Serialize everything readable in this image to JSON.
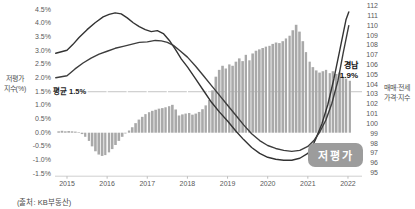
{
  "source_note": "(출처: KB부동산)",
  "chart_data": {
    "type": "combo-bar-line",
    "title": "",
    "left_axis": {
      "title_lines": [
        "저평가",
        "지수(%)"
      ],
      "ticks": [
        "4.5%",
        "4.0%",
        "3.5%",
        "3.0%",
        "2.5%",
        "2.0%",
        "1.5%",
        "1.0%",
        "0.5%",
        "0.0%",
        "-0.5%",
        "-1.0%",
        "-1.5%"
      ],
      "max": 4.5,
      "min": -1.5,
      "step": 0.5
    },
    "right_axis": {
      "title_lines": [
        "매매·전세",
        "가격·지수"
      ],
      "ticks": [
        "112",
        "111",
        "110",
        "109",
        "108",
        "107",
        "106",
        "105",
        "104",
        "103",
        "102",
        "101",
        "100",
        "99",
        "98",
        "97",
        "96",
        "95"
      ],
      "max": 112,
      "min": 95,
      "step": 1
    },
    "x_axis": {
      "ticks": [
        "2015",
        "2016",
        "2017",
        "2018",
        "2019",
        "2020",
        "2021",
        "2022"
      ]
    },
    "average_line": {
      "label": "평균 1.5%",
      "value": 1.5
    },
    "series_label": {
      "region": "경남",
      "value": "1.9%"
    },
    "badge": {
      "label": "저평가"
    },
    "bars": {
      "id": "undervaluation-index",
      "axis": "left",
      "start_time": 2014.75,
      "monthly_values": [
        0.05,
        0.07,
        0.05,
        0.06,
        0.05,
        0.04,
        0.02,
        -0.05,
        -0.15,
        -0.3,
        -0.5,
        -0.68,
        -0.8,
        -0.85,
        -0.82,
        -0.72,
        -0.6,
        -0.45,
        -0.3,
        -0.15,
        -0.03,
        0.08,
        0.2,
        0.35,
        0.48,
        0.58,
        0.68,
        0.75,
        0.8,
        0.84,
        0.88,
        0.9,
        0.93,
        0.97,
        1.02,
        0.85,
        0.63,
        0.67,
        0.7,
        0.72,
        0.66,
        0.7,
        0.76,
        0.86,
        1.0,
        1.2,
        1.55,
        2.05,
        2.3,
        2.45,
        2.35,
        2.5,
        2.45,
        2.6,
        2.72,
        2.62,
        2.85,
        2.65,
        2.9,
        3.0,
        3.05,
        3.1,
        3.15,
        3.18,
        3.25,
        3.3,
        3.28,
        3.35,
        3.45,
        3.55,
        3.75,
        3.95,
        3.7,
        3.35,
        2.95,
        2.6,
        2.4,
        2.28,
        2.2,
        2.25,
        2.3,
        2.18,
        2.25,
        2.15,
        2.2,
        2.05,
        1.98,
        1.9
      ]
    },
    "lines": [
      {
        "id": "price-index-1",
        "axis": "right",
        "points": [
          [
            2014.72,
            107.2
          ],
          [
            2015.0,
            107.5
          ],
          [
            2015.15,
            108.1
          ],
          [
            2015.3,
            108.8
          ],
          [
            2015.5,
            109.6
          ],
          [
            2015.7,
            110.3
          ],
          [
            2015.9,
            110.9
          ],
          [
            2016.05,
            111.15
          ],
          [
            2016.2,
            111.3
          ],
          [
            2016.35,
            111.2
          ],
          [
            2016.5,
            110.8
          ],
          [
            2016.65,
            110.3
          ],
          [
            2016.8,
            109.9
          ],
          [
            2016.95,
            109.6
          ],
          [
            2017.1,
            109.4
          ],
          [
            2017.25,
            109.5
          ],
          [
            2017.4,
            109.2
          ],
          [
            2017.55,
            108.5
          ],
          [
            2017.7,
            107.6
          ],
          [
            2017.85,
            106.6
          ],
          [
            2018.0,
            105.8
          ],
          [
            2018.2,
            104.6
          ],
          [
            2018.4,
            103.4
          ],
          [
            2018.6,
            102.2
          ],
          [
            2018.8,
            101.2
          ],
          [
            2019.0,
            100.3
          ],
          [
            2019.2,
            99.3
          ],
          [
            2019.4,
            98.4
          ],
          [
            2019.6,
            97.6
          ],
          [
            2019.8,
            97.0
          ],
          [
            2020.0,
            96.6
          ],
          [
            2020.2,
            96.4
          ],
          [
            2020.4,
            96.3
          ],
          [
            2020.6,
            96.3
          ],
          [
            2020.8,
            96.5
          ],
          [
            2021.0,
            97.0
          ],
          [
            2021.1,
            97.6
          ],
          [
            2021.2,
            98.5
          ],
          [
            2021.35,
            100.0
          ],
          [
            2021.5,
            102.0
          ],
          [
            2021.65,
            104.6
          ],
          [
            2021.8,
            107.6
          ],
          [
            2021.95,
            110.6
          ],
          [
            2022.02,
            111.4
          ]
        ]
      },
      {
        "id": "price-index-2",
        "axis": "right",
        "points": [
          [
            2014.72,
            104.7
          ],
          [
            2015.0,
            104.9
          ],
          [
            2015.2,
            105.6
          ],
          [
            2015.4,
            106.2
          ],
          [
            2015.6,
            106.7
          ],
          [
            2015.8,
            107.1
          ],
          [
            2016.0,
            107.4
          ],
          [
            2016.2,
            107.7
          ],
          [
            2016.4,
            107.9
          ],
          [
            2016.6,
            108.1
          ],
          [
            2016.8,
            108.3
          ],
          [
            2017.0,
            108.35
          ],
          [
            2017.2,
            108.5
          ],
          [
            2017.35,
            108.45
          ],
          [
            2017.5,
            108.3
          ],
          [
            2017.65,
            108.0
          ],
          [
            2017.8,
            107.5
          ],
          [
            2018.0,
            106.8
          ],
          [
            2018.2,
            105.9
          ],
          [
            2018.4,
            104.9
          ],
          [
            2018.6,
            103.9
          ],
          [
            2018.8,
            102.9
          ],
          [
            2019.0,
            101.9
          ],
          [
            2019.2,
            100.9
          ],
          [
            2019.4,
            99.9
          ],
          [
            2019.6,
            99.0
          ],
          [
            2019.8,
            98.3
          ],
          [
            2020.0,
            97.8
          ],
          [
            2020.2,
            97.5
          ],
          [
            2020.4,
            97.3
          ],
          [
            2020.6,
            97.2
          ],
          [
            2020.8,
            97.3
          ],
          [
            2021.0,
            97.7
          ],
          [
            2021.15,
            98.3
          ],
          [
            2021.3,
            99.2
          ],
          [
            2021.45,
            100.4
          ],
          [
            2021.6,
            102.1
          ],
          [
            2021.75,
            104.4
          ],
          [
            2021.88,
            107.2
          ],
          [
            2022.02,
            110.0
          ]
        ]
      }
    ],
    "colors": {
      "bar": "#a9a9a9",
      "line1": "#333333",
      "line2": "#3d3d3d",
      "average_line": "#c4c4c4",
      "axis_line": "#cfcfcf",
      "badge_bg": "#9c9c9c",
      "badge_text": "#ffffff",
      "axis_text": "#595959",
      "annotation_text": "#111111"
    }
  }
}
